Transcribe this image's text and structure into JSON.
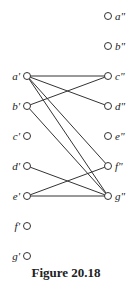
{
  "caption": "Figure 20.18",
  "left_nodes": [
    {
      "id": "a1",
      "label": "a'",
      "x": 27,
      "y": 76
    },
    {
      "id": "b1",
      "label": "b'",
      "x": 27,
      "y": 106
    },
    {
      "id": "c1",
      "label": "c'",
      "x": 27,
      "y": 136
    },
    {
      "id": "d1",
      "label": "d'",
      "x": 27,
      "y": 166
    },
    {
      "id": "e1",
      "label": "e'",
      "x": 27,
      "y": 196
    },
    {
      "id": "f1",
      "label": "f'",
      "x": 27,
      "y": 226
    },
    {
      "id": "g1",
      "label": "g'",
      "x": 27,
      "y": 256
    }
  ],
  "right_nodes": [
    {
      "id": "a2",
      "label": "a\"",
      "x": 108,
      "y": 16
    },
    {
      "id": "b2",
      "label": "b\"",
      "x": 108,
      "y": 46
    },
    {
      "id": "c2",
      "label": "c\"",
      "x": 108,
      "y": 76
    },
    {
      "id": "d2",
      "label": "d\"",
      "x": 108,
      "y": 106
    },
    {
      "id": "e2",
      "label": "e\"",
      "x": 108,
      "y": 136
    },
    {
      "id": "f2",
      "label": "f\"",
      "x": 108,
      "y": 166
    },
    {
      "id": "g2",
      "label": "g\"",
      "x": 108,
      "y": 196
    }
  ],
  "edges": [
    [
      "a1",
      "c2"
    ],
    [
      "a1",
      "d2"
    ],
    [
      "a1",
      "f2"
    ],
    [
      "a1",
      "g2"
    ],
    [
      "b1",
      "c2"
    ],
    [
      "b1",
      "g2"
    ],
    [
      "d1",
      "g2"
    ],
    [
      "e1",
      "f2"
    ],
    [
      "e1",
      "g2"
    ]
  ]
}
